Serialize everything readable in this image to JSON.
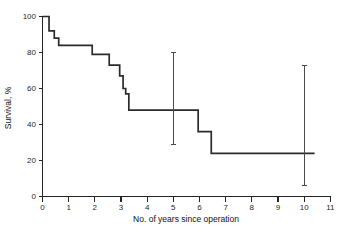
{
  "chart_data": {
    "type": "line",
    "subtype": "kaplan-meier-step",
    "title": "",
    "xlabel": "No. of years since operation",
    "ylabel": "Survival, %",
    "xlim": [
      0,
      11
    ],
    "ylim": [
      0,
      100
    ],
    "grid": false,
    "legend": null,
    "xticks": [
      0,
      1,
      2,
      3,
      4,
      5,
      6,
      7,
      8,
      9,
      10,
      11
    ],
    "xtick_labels": [
      "0",
      "1",
      "2",
      "3",
      "4",
      "5",
      "6",
      "7",
      "8",
      "9",
      "10",
      "11"
    ],
    "yticks": [
      0,
      20,
      40,
      60,
      80,
      100
    ],
    "ytick_labels": [
      "0",
      "20",
      "40",
      "60",
      "80",
      "100"
    ],
    "series": [
      {
        "name": "Survival",
        "step_points": [
          {
            "x": 0.0,
            "y": 100
          },
          {
            "x": 0.25,
            "y": 92
          },
          {
            "x": 0.45,
            "y": 88
          },
          {
            "x": 0.62,
            "y": 84
          },
          {
            "x": 1.9,
            "y": 79
          },
          {
            "x": 2.55,
            "y": 73
          },
          {
            "x": 2.95,
            "y": 67
          },
          {
            "x": 3.08,
            "y": 60
          },
          {
            "x": 3.18,
            "y": 57
          },
          {
            "x": 3.3,
            "y": 48
          },
          {
            "x": 5.95,
            "y": 36
          },
          {
            "x": 6.45,
            "y": 24
          },
          {
            "x": 10.4,
            "y": 24
          }
        ]
      }
    ],
    "error_bars": [
      {
        "x": 5,
        "y": 48,
        "low": 29,
        "high": 80
      },
      {
        "x": 10,
        "y": 24,
        "low": 6,
        "high": 73
      }
    ]
  },
  "labels": {
    "y_axis_title": "Survival, %",
    "x_axis_title": "No. of years since operation"
  }
}
